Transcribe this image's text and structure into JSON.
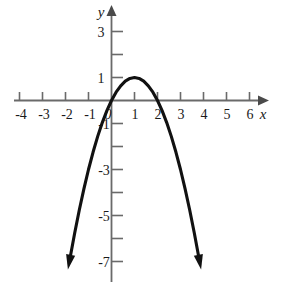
{
  "chart_data": {
    "type": "line",
    "title": "",
    "subtitle": "",
    "xlabel": "x",
    "ylabel": "y",
    "xlim": [
      -5,
      7
    ],
    "ylim": [
      -8,
      4
    ],
    "grid": false,
    "legend": null,
    "x_tick_labels": [
      "-4",
      "-3",
      "-2",
      "-1",
      "0",
      "1",
      "2",
      "3",
      "4",
      "5",
      "6"
    ],
    "x_tick_values": [
      -4,
      -3,
      -2,
      -1,
      0,
      1,
      2,
      3,
      4,
      5,
      6
    ],
    "y_tick_labels": [
      "3",
      "1",
      "-1",
      "-3",
      "-5",
      "-7"
    ],
    "y_tick_values": [
      3,
      1,
      -1,
      -3,
      -5,
      -7
    ],
    "y_minor_tick_values": [
      2,
      -2,
      -4,
      -6
    ],
    "curve": {
      "name": "parabola",
      "equation": "y = -(x - 1)^2 + 1",
      "vertex": [
        1,
        1
      ],
      "roots": [
        0,
        2
      ],
      "opens": "down",
      "color": "#111111",
      "x": [
        -1.83,
        -1.6,
        -1.4,
        -1.2,
        -1.0,
        -0.8,
        -0.6,
        -0.4,
        -0.2,
        0.0,
        0.2,
        0.4,
        0.6,
        0.8,
        1.0,
        1.2,
        1.4,
        1.6,
        1.8,
        2.0,
        2.2,
        2.4,
        2.6,
        2.8,
        3.0,
        3.2,
        3.4,
        3.6,
        3.8,
        3.83
      ],
      "y": [
        -7.0,
        -5.76,
        -4.76,
        -3.84,
        -3.0,
        -2.24,
        -1.56,
        -0.96,
        -0.44,
        0.0,
        0.36,
        0.64,
        0.84,
        0.96,
        1.0,
        0.96,
        0.84,
        0.64,
        0.36,
        0.0,
        -0.44,
        -0.96,
        -1.56,
        -2.24,
        -3.0,
        -3.84,
        -4.76,
        -5.76,
        -6.84,
        -7.0
      ]
    },
    "arrows": [
      "left-end-down",
      "right-end-down",
      "x-axis-right",
      "y-axis-up"
    ]
  },
  "labels": {
    "x_axis": "x",
    "y_axis": "y",
    "x": {
      "m4": "-4",
      "m3": "-3",
      "m2": "-2",
      "m1": "-1",
      "zero": "0",
      "p1": "1",
      "p2": "2",
      "p3": "3",
      "p4": "4",
      "p5": "5",
      "p6": "6"
    },
    "y": {
      "p3": "3",
      "p1": "1",
      "m1": "-1",
      "m3": "-3",
      "m5": "-5",
      "m7": "-7"
    }
  },
  "colors": {
    "axis": "#6a6a6a",
    "curve": "#111111",
    "text": "#1a1a1a",
    "background": "#ffffff"
  }
}
